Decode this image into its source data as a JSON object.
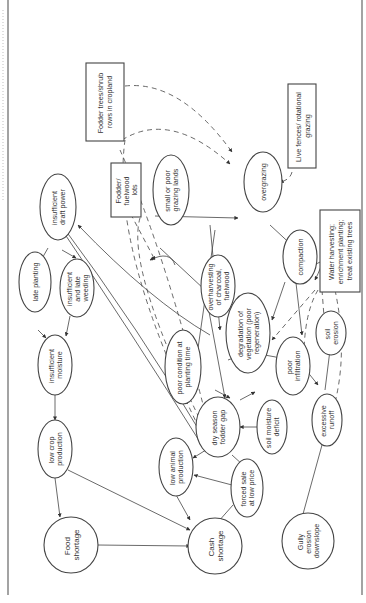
{
  "diagram": {
    "orientation": "rotated 90 degrees counter-clockwise",
    "nodes": {
      "insufficient_draft_power": [
        "insufficient",
        "draft power"
      ],
      "late_planting": [
        "late planting"
      ],
      "insufficient_late_weeding": [
        "insufficient",
        "and late",
        "weeding"
      ],
      "insufficient_moisture": [
        "insufficient",
        "moisture"
      ],
      "low_crop_production": [
        "low crop",
        "production"
      ],
      "food_shortage": [
        "Food",
        "shortage"
      ],
      "cash_shortage": [
        "Cash",
        "shortage"
      ],
      "low_animal_production": [
        "low animal",
        "production"
      ],
      "forced_sale": [
        "forced sale",
        "at low price"
      ],
      "dry_season_fodder_gap": [
        "dry season",
        "fodder gap"
      ],
      "poor_condition_planting": [
        "poor condition at",
        "planting time"
      ],
      "small_poor_grazing": [
        "small or poor",
        "grazing lands"
      ],
      "overharvesting": [
        "overharvesting",
        "of charcoal,",
        "fuelwood"
      ],
      "overgrazing": [
        "overgrazing"
      ],
      "degradation": [
        "degradation of",
        "vegetation (poor",
        "regeneration)"
      ],
      "compaction": [
        "compaction"
      ],
      "soil_erosion": [
        "soil",
        "erosion"
      ],
      "poor_infiltration": [
        "poor",
        "infiltration"
      ],
      "soil_moisture_deficit": [
        "soil moisture",
        "deficit"
      ],
      "excessive_runoff": [
        "excessive",
        "runoff"
      ],
      "gully_erosion": [
        "Gully",
        "erosion",
        "downslope"
      ]
    },
    "interventions": {
      "fodder_trees": [
        "Fodder trees/shrub",
        "rows in cropland"
      ],
      "fodder_fuelwood_lots": [
        "Fodder/",
        "fuelwood",
        "lots"
      ],
      "live_fences": [
        "Live fences/ rotational",
        "grazing"
      ],
      "water_harvesting": [
        "Water harvesting;",
        "enrichment planting;",
        "treat existing trees"
      ]
    }
  }
}
